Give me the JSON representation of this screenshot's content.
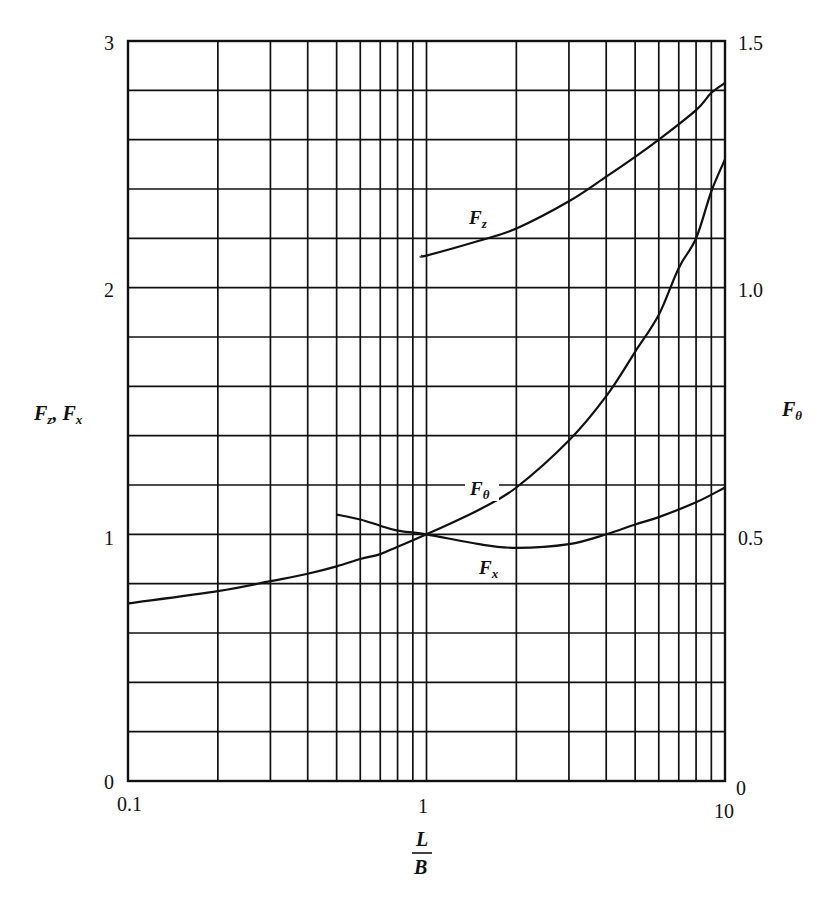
{
  "chart_data": {
    "type": "line",
    "title": "",
    "xlabel": "L/B",
    "xlabel_numerator": "L",
    "xlabel_denominator": "B",
    "xscale": "log",
    "xlim": [
      0.1,
      10
    ],
    "x_ticks": [
      "0.1",
      "1",
      "10"
    ],
    "ylabel_left": "Fz, Fx",
    "ylabel_left_parts": {
      "f1": "F",
      "s1": "z",
      "sep": ", ",
      "f2": "F",
      "s2": "x"
    },
    "ylim_left": [
      0,
      3
    ],
    "y_ticks_left": [
      "0",
      "1",
      "2",
      "3"
    ],
    "ylabel_right": "Fθ",
    "ylabel_right_parts": {
      "f": "F",
      "s": "θ"
    },
    "ylim_right": [
      0,
      1.5
    ],
    "y_ticks_right": [
      "0",
      "0.5",
      "1.0",
      "1.5"
    ],
    "grid": true,
    "series": [
      {
        "name": "Fz",
        "label_main": "F",
        "label_sub": "z",
        "axis": "left",
        "x": [
          0.96,
          1.0,
          1.5,
          2,
          3,
          4,
          5,
          6,
          8,
          9,
          10
        ],
        "y": [
          2.13,
          2.13,
          2.19,
          2.24,
          2.35,
          2.45,
          2.53,
          2.6,
          2.72,
          2.79,
          2.83
        ]
      },
      {
        "name": "Fθ",
        "label_main": "F",
        "label_sub": "θ",
        "axis": "right",
        "x": [
          0.1,
          0.2,
          0.3,
          0.4,
          0.5,
          0.6,
          0.7,
          0.8,
          1.0,
          1.5,
          2,
          3,
          4,
          5,
          6,
          7,
          8,
          9,
          10
        ],
        "y": [
          0.36,
          0.385,
          0.405,
          0.42,
          0.435,
          0.45,
          0.46,
          0.475,
          0.5,
          0.55,
          0.595,
          0.69,
          0.78,
          0.87,
          0.945,
          1.04,
          1.1,
          1.195,
          1.26
        ]
      },
      {
        "name": "Fx",
        "label_main": "F",
        "label_sub": "x",
        "axis": "left",
        "x": [
          0.5,
          0.6,
          0.7,
          0.8,
          1.0,
          1.5,
          2,
          3,
          4,
          5,
          6,
          8,
          10
        ],
        "y": [
          1.08,
          1.06,
          1.035,
          1.015,
          1.0,
          0.96,
          0.945,
          0.96,
          1.0,
          1.04,
          1.07,
          1.13,
          1.19
        ]
      }
    ]
  }
}
